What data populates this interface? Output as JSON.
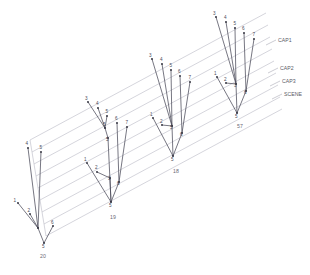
{
  "figure": {
    "title": "",
    "background_color": "#ffffff",
    "edge_color": "#4a4a58",
    "grid_color": "#b9b9c4",
    "label_color": "#5a5a66"
  },
  "chart_data": {
    "type": "diagram",
    "title": "",
    "xlabel": "",
    "ylabel": "",
    "grid": true,
    "legend_position": "right",
    "plane_labels": [
      "CAP1",
      "CAP2",
      "CAP3",
      "SCENE"
    ],
    "cluster_labels": [
      "20",
      "19",
      "18",
      "57"
    ],
    "node_labels_per_cluster": [
      [
        "1",
        "2",
        "4",
        "5",
        "6",
        "5"
      ],
      [
        "1",
        "2",
        "3",
        "3",
        "4",
        "5",
        "5",
        "6",
        "7",
        "5"
      ],
      [
        "1",
        "2",
        "3",
        "3",
        "4",
        "5",
        "6",
        "7",
        "6",
        "5"
      ],
      [
        "1",
        "2",
        "3",
        "3",
        "4",
        "5",
        "6",
        "7",
        "6",
        "5"
      ]
    ],
    "n_clusters": 4,
    "n_planes": 4
  },
  "planes": {
    "items": [
      {
        "id": "cap1",
        "label": "CAP1"
      },
      {
        "id": "cap2",
        "label": "CAP2"
      },
      {
        "id": "cap3",
        "label": "CAP3"
      },
      {
        "id": "scene",
        "label": "SCENE"
      }
    ]
  },
  "clusters": [
    {
      "id": "cluster-20",
      "label": "20",
      "label_x": 43,
      "label_y": 258,
      "nodes": [
        {
          "id": "n1",
          "label": "1",
          "x": 18,
          "y": 203,
          "lx": 13.5,
          "ly": 202
        },
        {
          "id": "n2",
          "label": "2",
          "x": 30,
          "y": 214,
          "lx": 27.5,
          "ly": 211.5
        },
        {
          "id": "n4",
          "label": "4",
          "x": 28,
          "y": 148,
          "lx": 25.5,
          "ly": 145
        },
        {
          "id": "n5t",
          "label": "5",
          "x": 41,
          "y": 152,
          "lx": 39.5,
          "ly": 149
        },
        {
          "id": "nj",
          "label": "",
          "x": 38,
          "y": 228,
          "lx": 0,
          "ly": 0
        },
        {
          "id": "n6",
          "label": "6",
          "x": 53,
          "y": 226,
          "lx": 51,
          "ly": 223.5
        },
        {
          "id": "nr",
          "label": "5",
          "x": 44,
          "y": 243,
          "lx": 42,
          "ly": 248
        }
      ],
      "edges": [
        [
          "n1",
          "nj"
        ],
        [
          "n2",
          "nj"
        ],
        [
          "n4",
          "nj"
        ],
        [
          "n5t",
          "nj"
        ],
        [
          "nj",
          "nr"
        ],
        [
          "n6",
          "nr"
        ]
      ]
    },
    {
      "id": "cluster-19",
      "label": "19",
      "label_x": 113,
      "label_y": 219,
      "nodes": [
        {
          "id": "n3t",
          "label": "3",
          "x": 88,
          "y": 102,
          "lx": 85,
          "ly": 100
        },
        {
          "id": "n4t",
          "label": "4",
          "x": 98,
          "y": 108,
          "lx": 96,
          "ly": 105
        },
        {
          "id": "n5t",
          "label": "5",
          "x": 107,
          "y": 116,
          "lx": 105.5,
          "ly": 113
        },
        {
          "id": "nm",
          "label": "5",
          "x": 105,
          "y": 128,
          "lx": 103,
          "ly": 126
        },
        {
          "id": "nmid",
          "label": "5",
          "x": 108,
          "y": 138,
          "lx": 106,
          "ly": 141
        },
        {
          "id": "n6t",
          "label": "6",
          "x": 117,
          "y": 123,
          "lx": 115,
          "ly": 120
        },
        {
          "id": "n7t",
          "label": "7",
          "x": 127,
          "y": 127,
          "lx": 125.5,
          "ly": 124
        },
        {
          "id": "n1",
          "label": "1",
          "x": 87,
          "y": 163,
          "lx": 84,
          "ly": 161
        },
        {
          "id": "n2",
          "label": "2",
          "x": 97,
          "y": 172,
          "lx": 95,
          "ly": 169
        },
        {
          "id": "n3m",
          "label": "3",
          "x": 110,
          "y": 178,
          "lx": 108,
          "ly": 180
        },
        {
          "id": "n6b",
          "label": "6",
          "x": 119,
          "y": 182,
          "lx": 117,
          "ly": 185
        },
        {
          "id": "nr",
          "label": "5",
          "x": 111,
          "y": 202,
          "lx": 109,
          "ly": 207
        }
      ],
      "edges": [
        [
          "n3t",
          "nm"
        ],
        [
          "n4t",
          "nm"
        ],
        [
          "n5t",
          "nm"
        ],
        [
          "nm",
          "nmid"
        ],
        [
          "nmid",
          "nr"
        ],
        [
          "n6t",
          "n6b"
        ],
        [
          "n7t",
          "n6b"
        ],
        [
          "n1",
          "nr"
        ],
        [
          "n2",
          "n3m"
        ],
        [
          "n3m",
          "nr"
        ],
        [
          "n6b",
          "nr"
        ]
      ]
    },
    {
      "id": "cluster-18",
      "label": "18",
      "label_x": 176,
      "label_y": 173,
      "nodes": [
        {
          "id": "n3t",
          "label": "3",
          "x": 152,
          "y": 59,
          "lx": 149,
          "ly": 57
        },
        {
          "id": "n4t",
          "label": "4",
          "x": 162,
          "y": 64,
          "lx": 160,
          "ly": 61
        },
        {
          "id": "n5t",
          "label": "5",
          "x": 171,
          "y": 70,
          "lx": 169.5,
          "ly": 67
        },
        {
          "id": "n6t",
          "label": "6",
          "x": 180,
          "y": 76,
          "lx": 178,
          "ly": 73
        },
        {
          "id": "n7t",
          "label": "7",
          "x": 190,
          "y": 82,
          "lx": 188.5,
          "ly": 79
        },
        {
          "id": "nc",
          "label": "5",
          "x": 172,
          "y": 126,
          "lx": 170,
          "ly": 129
        },
        {
          "id": "n1",
          "label": "1",
          "x": 153,
          "y": 118,
          "lx": 150,
          "ly": 116
        },
        {
          "id": "n2",
          "label": "2",
          "x": 162,
          "y": 125,
          "lx": 160,
          "ly": 123
        },
        {
          "id": "n6b",
          "label": "6",
          "x": 182,
          "y": 133,
          "lx": 180,
          "ly": 136
        },
        {
          "id": "nr",
          "label": "5",
          "x": 173,
          "y": 156,
          "lx": 171,
          "ly": 161
        }
      ],
      "edges": [
        [
          "n3t",
          "nc"
        ],
        [
          "n4t",
          "nc"
        ],
        [
          "n5t",
          "nc"
        ],
        [
          "n6t",
          "n6b"
        ],
        [
          "n7t",
          "n6b"
        ],
        [
          "n1",
          "nr"
        ],
        [
          "n2",
          "nc"
        ],
        [
          "nc",
          "nr"
        ],
        [
          "n6b",
          "nr"
        ]
      ]
    },
    {
      "id": "cluster-57",
      "label": "57",
      "label_x": 240,
      "label_y": 128,
      "nodes": [
        {
          "id": "n3t",
          "label": "3",
          "x": 216,
          "y": 17,
          "lx": 213,
          "ly": 15
        },
        {
          "id": "n4t",
          "label": "4",
          "x": 226,
          "y": 22,
          "lx": 224,
          "ly": 19
        },
        {
          "id": "n5t",
          "label": "5",
          "x": 235,
          "y": 28,
          "lx": 233.5,
          "ly": 25
        },
        {
          "id": "n6t",
          "label": "6",
          "x": 244,
          "y": 33,
          "lx": 242,
          "ly": 30
        },
        {
          "id": "n7t",
          "label": "7",
          "x": 254,
          "y": 39,
          "lx": 252.5,
          "ly": 36
        },
        {
          "id": "nc",
          "label": "3",
          "x": 236,
          "y": 84,
          "lx": 234,
          "ly": 87
        },
        {
          "id": "n1",
          "label": "1",
          "x": 217,
          "y": 77,
          "lx": 214,
          "ly": 75
        },
        {
          "id": "n2",
          "label": "2",
          "x": 226,
          "y": 83,
          "lx": 224,
          "ly": 81
        },
        {
          "id": "n6b",
          "label": "6",
          "x": 246,
          "y": 91,
          "lx": 244,
          "ly": 94
        },
        {
          "id": "nr",
          "label": "5",
          "x": 237,
          "y": 113,
          "lx": 235,
          "ly": 118
        }
      ],
      "edges": [
        [
          "n3t",
          "nc"
        ],
        [
          "n4t",
          "nc"
        ],
        [
          "n5t",
          "nc"
        ],
        [
          "n6t",
          "n6b"
        ],
        [
          "n7t",
          "n6b"
        ],
        [
          "n1",
          "nr"
        ],
        [
          "n2",
          "nc"
        ],
        [
          "nc",
          "nr"
        ],
        [
          "n6b",
          "nr"
        ]
      ]
    }
  ],
  "grid": {
    "lines": [
      {
        "id": "g1",
        "x1": 30,
        "y1": 140,
        "x2": 266,
        "y2": 13
      },
      {
        "id": "g2",
        "x1": 32,
        "y1": 152,
        "x2": 268,
        "y2": 25
      },
      {
        "id": "g3",
        "x1": 34,
        "y1": 164,
        "x2": 270,
        "y2": 37
      },
      {
        "id": "g4",
        "x1": 36,
        "y1": 176,
        "x2": 272,
        "y2": 49
      },
      {
        "id": "g5",
        "x1": 38,
        "y1": 188,
        "x2": 274,
        "y2": 61
      },
      {
        "id": "g6",
        "x1": 40,
        "y1": 200,
        "x2": 276,
        "y2": 73
      },
      {
        "id": "g7",
        "x1": 42,
        "y1": 212,
        "x2": 278,
        "y2": 85
      },
      {
        "id": "g8",
        "x1": 44,
        "y1": 224,
        "x2": 280,
        "y2": 97
      },
      {
        "id": "g9",
        "x1": 46,
        "y1": 236,
        "x2": 282,
        "y2": 109
      }
    ],
    "left_edge": {
      "x1": 30,
      "y1": 140,
      "x2": 46,
      "y2": 236
    }
  },
  "leaders": [
    {
      "id": "leader-cap1",
      "x1": 266,
      "y1": 45,
      "x2": 276,
      "y2": 40,
      "label": "CAP1",
      "lx": 278,
      "ly": 42
    },
    {
      "id": "leader-cap2",
      "x1": 268,
      "y1": 73,
      "x2": 278,
      "y2": 68,
      "label": "CAP2",
      "lx": 280,
      "ly": 70
    },
    {
      "id": "leader-cap3",
      "x1": 270,
      "y1": 86,
      "x2": 280,
      "y2": 81,
      "label": "CAP3",
      "lx": 282,
      "ly": 83
    },
    {
      "id": "leader-scene",
      "x1": 272,
      "y1": 99,
      "x2": 282,
      "y2": 94,
      "label": "SCENE",
      "lx": 284,
      "ly": 96
    }
  ]
}
